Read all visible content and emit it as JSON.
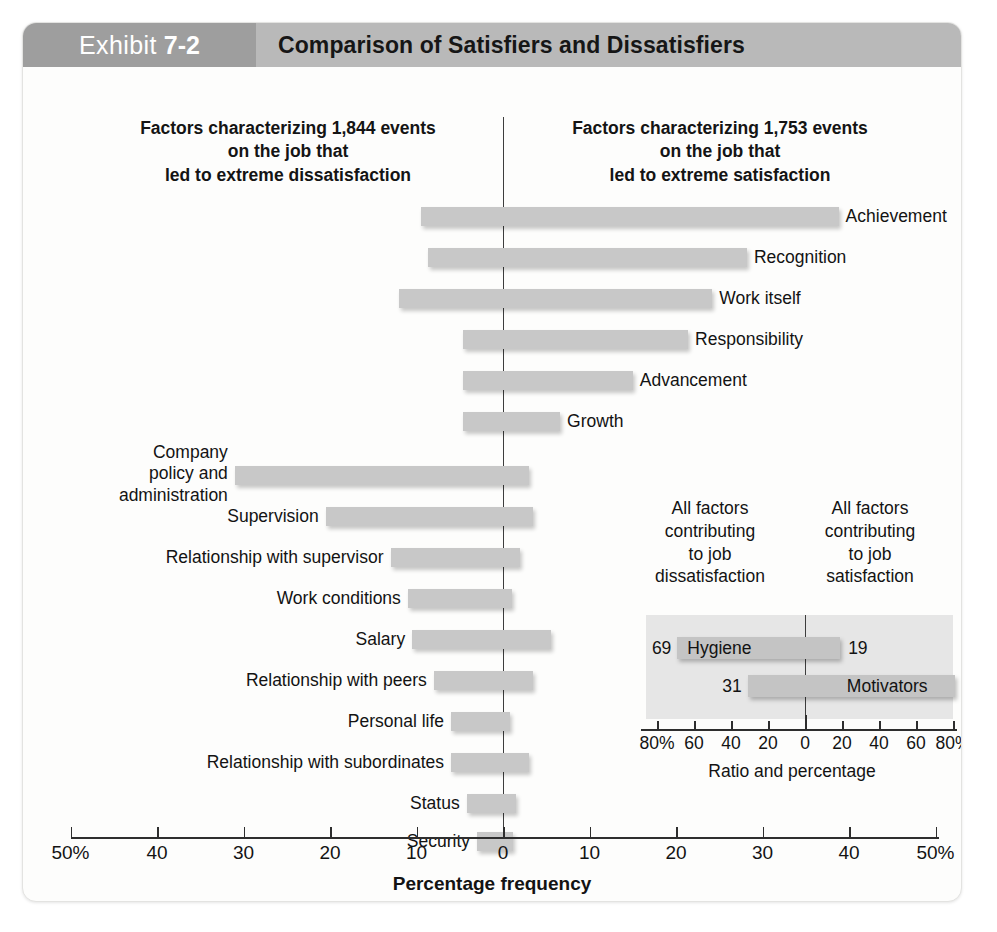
{
  "exhibit": {
    "label": "Exhibit",
    "number": "7-2",
    "title": "Comparison of Satisfiers and Dissatisfiers"
  },
  "captions": {
    "left": "Factors characterizing 1,844 events\non the job that\nled to extreme dissatisfaction",
    "right": "Factors characterizing 1,753 events\non the job that\nled to extreme satisfaction"
  },
  "chart_data": {
    "type": "bar",
    "title": "Comparison of Satisfiers and Dissatisfiers",
    "xlabel": "Percentage frequency",
    "ylabel": "",
    "xlim": [
      -50,
      50
    ],
    "xticks": [
      -50,
      -40,
      -30,
      -20,
      -10,
      0,
      10,
      20,
      30,
      40,
      50
    ],
    "xticklabels": [
      "50%",
      "40",
      "30",
      "20",
      "10",
      "0",
      "10",
      "20",
      "30",
      "40",
      "50%"
    ],
    "grid": false,
    "legend": "none",
    "orientation": "horizontal-diverging",
    "note": "Each bar spans from a negative (dissatisfaction) percentage to a positive (satisfaction) percentage.",
    "series": [
      {
        "name": "Motivators",
        "items": [
          {
            "label": "Achievement",
            "dissatisfaction": -9.5,
            "satisfaction": 38.8,
            "label_side": "right"
          },
          {
            "label": "Recognition",
            "dissatisfaction": -8.7,
            "satisfaction": 28.2,
            "label_side": "right"
          },
          {
            "label": "Work itself",
            "dissatisfaction": -12.0,
            "satisfaction": 24.2,
            "label_side": "right"
          },
          {
            "label": "Responsibility",
            "dissatisfaction": -4.6,
            "satisfaction": 21.4,
            "label_side": "right"
          },
          {
            "label": "Advancement",
            "dissatisfaction": -4.6,
            "satisfaction": 15.0,
            "label_side": "right"
          },
          {
            "label": "Growth",
            "dissatisfaction": -4.6,
            "satisfaction": 6.6,
            "label_side": "right"
          }
        ]
      },
      {
        "name": "Hygiene factors",
        "items": [
          {
            "label": "Company\npolicy and\nadministration",
            "dissatisfaction": -31.0,
            "satisfaction": 3.0,
            "label_side": "left"
          },
          {
            "label": "Supervision",
            "dissatisfaction": -20.5,
            "satisfaction": 3.5,
            "label_side": "left"
          },
          {
            "label": "Relationship with supervisor",
            "dissatisfaction": -13.0,
            "satisfaction": 2.0,
            "label_side": "left"
          },
          {
            "label": "Work conditions",
            "dissatisfaction": -11.0,
            "satisfaction": 1.0,
            "label_side": "left"
          },
          {
            "label": "Salary",
            "dissatisfaction": -10.5,
            "satisfaction": 5.5,
            "label_side": "left"
          },
          {
            "label": "Relationship with peers",
            "dissatisfaction": -8.0,
            "satisfaction": 3.5,
            "label_side": "left"
          },
          {
            "label": "Personal life",
            "dissatisfaction": -6.0,
            "satisfaction": 0.8,
            "label_side": "left"
          },
          {
            "label": "Relationship with subordinates",
            "dissatisfaction": -6.0,
            "satisfaction": 3.0,
            "label_side": "left"
          },
          {
            "label": "Status",
            "dissatisfaction": -4.2,
            "satisfaction": 1.5,
            "label_side": "left"
          },
          {
            "label": "Security",
            "dissatisfaction": -3.0,
            "satisfaction": 1.2,
            "label_side": "left"
          }
        ]
      }
    ]
  },
  "inset": {
    "caption_left": "All factors\ncontributing\nto job\ndissatisfaction",
    "caption_right": "All factors\ncontributing\nto job\nsatisfaction",
    "axis_title": "Ratio and percentage",
    "xticklabels": [
      "80%",
      "60",
      "40",
      "20",
      "0",
      "20",
      "40",
      "60",
      "80%"
    ],
    "xticks": [
      -80,
      -60,
      -40,
      -20,
      0,
      20,
      40,
      60,
      80
    ],
    "rows": [
      {
        "name": "Hygiene",
        "left_value": "69",
        "right_value": "19",
        "left_pct": -69,
        "right_pct": 19,
        "name_side": "left"
      },
      {
        "name": "Motivators",
        "left_value": "31",
        "right_value": "81",
        "left_pct": -31,
        "right_pct": 81,
        "name_side": "right"
      }
    ]
  },
  "colors": {
    "header_band": "#b9b9b9",
    "exhibit_tab": "#9e9e9e",
    "bar": "#c8c8c8",
    "inset_panel": "#e6e6e6",
    "axis": "#2e2e2e",
    "text": "#131313"
  }
}
